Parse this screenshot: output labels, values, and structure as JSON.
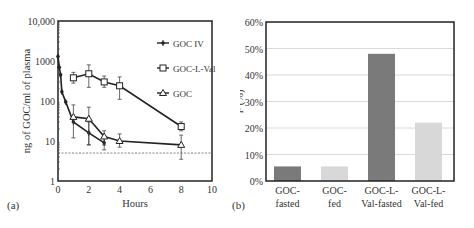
{
  "panels": {
    "a": {
      "label": "(a)"
    },
    "b": {
      "label": "(b)"
    }
  },
  "chart_data": [
    {
      "type": "line",
      "panel": "(a)",
      "title": "",
      "xlabel": "Hours",
      "ylabel": "ng of GOC/ml of plasma",
      "yscale": "log",
      "xlim": [
        0,
        10
      ],
      "ylim": [
        1,
        10000
      ],
      "xticks": [
        0,
        2,
        4,
        6,
        8,
        10
      ],
      "yticks": [
        1,
        10,
        100,
        1000,
        10000
      ],
      "ytick_labels": [
        "1",
        "10",
        "100",
        "1000",
        "10,000"
      ],
      "grid": false,
      "legend_position": "upper right",
      "reference_line": {
        "y": 5,
        "style": "dashed"
      },
      "series": [
        {
          "name": "GOC IV",
          "marker": "plus",
          "x": [
            0,
            0.08,
            0.17,
            0.25,
            0.5,
            1,
            2,
            3
          ],
          "y": [
            1300,
            700,
            450,
            170,
            95,
            30,
            16,
            9
          ],
          "err_low": [
            0,
            0,
            0,
            0,
            0,
            0,
            8,
            6
          ],
          "err_high": [
            0,
            0,
            0,
            0,
            0,
            0,
            30,
            12
          ]
        },
        {
          "name": "GOC-L-Val",
          "marker": "square",
          "x": [
            1,
            2,
            3,
            4,
            8
          ],
          "y": [
            380,
            480,
            300,
            240,
            23
          ],
          "err_low": [
            280,
            220,
            220,
            110,
            18
          ],
          "err_high": [
            520,
            800,
            420,
            400,
            30
          ]
        },
        {
          "name": "GOC",
          "marker": "triangle",
          "x": [
            1,
            2,
            3,
            4,
            8
          ],
          "y": [
            40,
            36,
            13,
            10,
            8
          ],
          "err_low": [
            12,
            8,
            8,
            7,
            3.5
          ],
          "err_high": [
            80,
            70,
            18,
            15,
            14
          ]
        }
      ]
    },
    {
      "type": "bar",
      "panel": "(b)",
      "title": "",
      "xlabel": "",
      "ylabel": "F (%)",
      "ylim": [
        0,
        60
      ],
      "yticks": [
        "0%",
        "10%",
        "20%",
        "30%",
        "40%",
        "50%",
        "60%"
      ],
      "grid": true,
      "categories": [
        "GOC-fasted",
        "GOC-fed",
        "GOC-L-Val-fasted",
        "GOC-L-Val-fed"
      ],
      "category_lines": [
        [
          "GOC-",
          "fasted"
        ],
        [
          "GOC-",
          "fed"
        ],
        [
          "GOC-L-",
          "Val-fasted"
        ],
        [
          "GOC-L-",
          "Val-fed"
        ]
      ],
      "values": [
        5.5,
        5.5,
        48,
        22
      ],
      "colors": [
        "#7a7a7a",
        "#d8d8d8",
        "#7a7a7a",
        "#d8d8d8"
      ]
    }
  ]
}
